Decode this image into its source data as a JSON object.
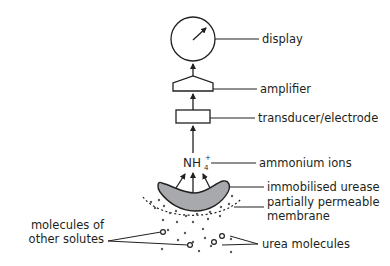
{
  "diagram": {
    "components": {
      "display": "display",
      "amplifier": "amplifier",
      "transducer": "transducer/electrode",
      "ammonium": "ammonium ions",
      "urease": "immobilised urease",
      "membrane_line1": "partially permeable",
      "membrane_line2": "membrane",
      "urea": "urea molecules",
      "other_line1": "molecules of",
      "other_line2": "other solutes"
    },
    "chem": {
      "ion_formula": "NH",
      "ion_subscript": "4",
      "ion_charge": "+"
    },
    "colors": {
      "line": "#231f20",
      "urease_fill": "#a7a9ac",
      "dots": "#5a5a5a"
    }
  }
}
